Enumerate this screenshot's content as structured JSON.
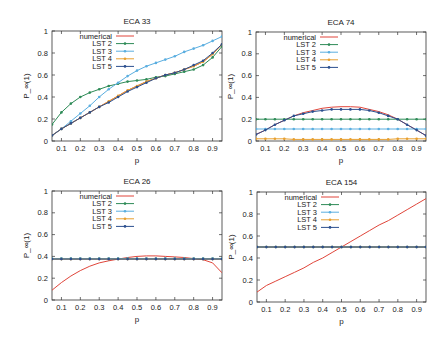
{
  "chart_data": [
    {
      "type": "line",
      "title": "ECA 33",
      "xlabel": "p",
      "ylabel": "P_∞(1)",
      "xlim": [
        0.05,
        0.95
      ],
      "ylim": [
        0,
        1
      ],
      "xticks": [
        "0.1",
        "0.2",
        "0.3",
        "0.4",
        "0.5",
        "0.6",
        "0.7",
        "0.8",
        "0.9"
      ],
      "yticks": [
        "0",
        "0.2",
        "0.4",
        "0.6",
        "0.8",
        "1"
      ],
      "legend": "top-left",
      "x": [
        0.05,
        0.1,
        0.15,
        0.2,
        0.25,
        0.3,
        0.35,
        0.4,
        0.45,
        0.5,
        0.55,
        0.6,
        0.65,
        0.7,
        0.75,
        0.8,
        0.85,
        0.9,
        0.95
      ],
      "series": [
        {
          "name": "numerical",
          "color": "#e0453a",
          "markers": false,
          "values": [
            0.05,
            0.11,
            0.16,
            0.21,
            0.26,
            0.31,
            0.36,
            0.41,
            0.46,
            0.5,
            0.54,
            0.57,
            0.6,
            0.62,
            0.65,
            0.68,
            0.72,
            0.79,
            0.88
          ]
        },
        {
          "name": "LST 2",
          "color": "#2e8b57",
          "markers": true,
          "values": [
            0.15,
            0.26,
            0.34,
            0.4,
            0.44,
            0.47,
            0.5,
            0.52,
            0.54,
            0.55,
            0.56,
            0.58,
            0.59,
            0.61,
            0.63,
            0.65,
            0.69,
            0.76,
            0.86
          ]
        },
        {
          "name": "LST 3",
          "color": "#5aaee0",
          "markers": true,
          "values": [
            0.05,
            0.11,
            0.18,
            0.25,
            0.32,
            0.4,
            0.47,
            0.53,
            0.59,
            0.64,
            0.68,
            0.71,
            0.74,
            0.77,
            0.81,
            0.84,
            0.87,
            0.91,
            0.95
          ]
        },
        {
          "name": "LST 4",
          "color": "#e8a030",
          "markers": true,
          "values": [
            0.05,
            0.11,
            0.16,
            0.21,
            0.26,
            0.31,
            0.36,
            0.41,
            0.46,
            0.5,
            0.54,
            0.57,
            0.6,
            0.62,
            0.65,
            0.68,
            0.72,
            0.79,
            0.88
          ]
        },
        {
          "name": "LST 5",
          "color": "#2b4f8e",
          "markers": true,
          "values": [
            0.05,
            0.11,
            0.16,
            0.21,
            0.26,
            0.31,
            0.35,
            0.4,
            0.45,
            0.49,
            0.53,
            0.57,
            0.6,
            0.62,
            0.65,
            0.69,
            0.73,
            0.8,
            0.88
          ]
        }
      ]
    },
    {
      "type": "line",
      "title": "ECA 74",
      "xlabel": "p",
      "ylabel": "P_∞(1)",
      "xlim": [
        0.05,
        0.95
      ],
      "ylim": [
        0,
        1
      ],
      "xticks": [
        "0.1",
        "0.2",
        "0.3",
        "0.4",
        "0.5",
        "0.6",
        "0.7",
        "0.8",
        "0.9"
      ],
      "yticks": [
        "0",
        "0.2",
        "0.4",
        "0.6",
        "0.8",
        "1"
      ],
      "legend": "top-left",
      "x": [
        0.05,
        0.1,
        0.15,
        0.2,
        0.25,
        0.3,
        0.35,
        0.4,
        0.45,
        0.5,
        0.55,
        0.6,
        0.65,
        0.7,
        0.75,
        0.8,
        0.85,
        0.9,
        0.95
      ],
      "series": [
        {
          "name": "numerical",
          "color": "#e0453a",
          "markers": false,
          "values": [
            0.06,
            0.1,
            0.15,
            0.19,
            0.23,
            0.26,
            0.28,
            0.3,
            0.31,
            0.315,
            0.315,
            0.31,
            0.29,
            0.27,
            0.24,
            0.2,
            0.15,
            0.1,
            0.05
          ]
        },
        {
          "name": "LST 2",
          "color": "#2e8b57",
          "markers": true,
          "values": [
            0.2,
            0.2,
            0.2,
            0.2,
            0.2,
            0.2,
            0.2,
            0.2,
            0.2,
            0.2,
            0.2,
            0.2,
            0.2,
            0.2,
            0.2,
            0.2,
            0.2,
            0.2,
            0.2
          ]
        },
        {
          "name": "LST 3",
          "color": "#5aaee0",
          "markers": true,
          "values": [
            0.11,
            0.11,
            0.11,
            0.11,
            0.11,
            0.11,
            0.11,
            0.11,
            0.11,
            0.11,
            0.11,
            0.11,
            0.11,
            0.11,
            0.11,
            0.11,
            0.11,
            0.11,
            0.11
          ]
        },
        {
          "name": "LST 4",
          "color": "#e8a030",
          "markers": true,
          "values": [
            0.02,
            0.02,
            0.02,
            0.02,
            0.015,
            0.015,
            0.015,
            0.015,
            0.015,
            0.015,
            0.015,
            0.015,
            0.015,
            0.015,
            0.015,
            0.02,
            0.02,
            0.02,
            0.02
          ]
        },
        {
          "name": "LST 5",
          "color": "#2b4f8e",
          "markers": true,
          "values": [
            0.06,
            0.1,
            0.15,
            0.19,
            0.23,
            0.25,
            0.27,
            0.28,
            0.29,
            0.29,
            0.29,
            0.29,
            0.28,
            0.26,
            0.23,
            0.2,
            0.15,
            0.1,
            0.05
          ]
        }
      ]
    },
    {
      "type": "line",
      "title": "ECA 26",
      "xlabel": "p",
      "ylabel": "P_∞(1)",
      "xlim": [
        0.05,
        0.95
      ],
      "ylim": [
        0,
        1
      ],
      "xticks": [
        "0.1",
        "0.2",
        "0.3",
        "0.4",
        "0.5",
        "0.6",
        "0.7",
        "0.8",
        "0.9"
      ],
      "yticks": [
        "0",
        "0.2",
        "0.4",
        "0.6",
        "0.8",
        "1"
      ],
      "legend": "top-left",
      "x": [
        0.05,
        0.1,
        0.15,
        0.2,
        0.25,
        0.3,
        0.35,
        0.4,
        0.45,
        0.5,
        0.55,
        0.6,
        0.65,
        0.7,
        0.75,
        0.8,
        0.85,
        0.9,
        0.95
      ],
      "series": [
        {
          "name": "numerical",
          "color": "#e0453a",
          "markers": false,
          "values": [
            0.09,
            0.16,
            0.22,
            0.27,
            0.31,
            0.34,
            0.36,
            0.375,
            0.39,
            0.4,
            0.405,
            0.405,
            0.4,
            0.395,
            0.39,
            0.38,
            0.37,
            0.34,
            0.25
          ]
        },
        {
          "name": "LST 2",
          "color": "#2e8b57",
          "markers": true,
          "values": [
            0.38,
            0.38,
            0.38,
            0.38,
            0.38,
            0.38,
            0.38,
            0.38,
            0.38,
            0.38,
            0.38,
            0.38,
            0.38,
            0.38,
            0.38,
            0.38,
            0.38,
            0.38,
            0.38
          ]
        },
        {
          "name": "LST 3",
          "color": "#5aaee0",
          "markers": true,
          "values": [
            0.38,
            0.38,
            0.38,
            0.38,
            0.38,
            0.38,
            0.38,
            0.38,
            0.38,
            0.38,
            0.38,
            0.38,
            0.38,
            0.38,
            0.38,
            0.38,
            0.38,
            0.38,
            0.38
          ]
        },
        {
          "name": "LST 4",
          "color": "#e8a030",
          "markers": true,
          "values": [
            0.375,
            0.375,
            0.375,
            0.375,
            0.375,
            0.375,
            0.375,
            0.375,
            0.375,
            0.375,
            0.375,
            0.375,
            0.375,
            0.375,
            0.375,
            0.375,
            0.375,
            0.375,
            0.375
          ]
        },
        {
          "name": "LST 5",
          "color": "#2b4f8e",
          "markers": true,
          "values": [
            0.375,
            0.375,
            0.375,
            0.375,
            0.375,
            0.375,
            0.375,
            0.375,
            0.375,
            0.375,
            0.375,
            0.375,
            0.375,
            0.375,
            0.375,
            0.375,
            0.375,
            0.375,
            0.375
          ]
        }
      ]
    },
    {
      "type": "line",
      "title": "ECA 154",
      "xlabel": "p",
      "ylabel": "P_∞(1)",
      "xlim": [
        0.05,
        0.95
      ],
      "ylim": [
        0,
        1
      ],
      "xticks": [
        "0.1",
        "0.2",
        "0.3",
        "0.4",
        "0.5",
        "0.6",
        "0.7",
        "0.8",
        "0.9"
      ],
      "yticks": [
        "0",
        "0.2",
        "0.4",
        "0.6",
        "0.8",
        "1"
      ],
      "legend": "top-left",
      "x": [
        0.05,
        0.1,
        0.15,
        0.2,
        0.25,
        0.3,
        0.35,
        0.4,
        0.45,
        0.5,
        0.55,
        0.6,
        0.65,
        0.7,
        0.75,
        0.8,
        0.85,
        0.9,
        0.95
      ],
      "series": [
        {
          "name": "numerical",
          "color": "#e0453a",
          "markers": false,
          "values": [
            0.09,
            0.15,
            0.19,
            0.23,
            0.27,
            0.31,
            0.36,
            0.4,
            0.45,
            0.5,
            0.55,
            0.6,
            0.65,
            0.7,
            0.74,
            0.79,
            0.84,
            0.89,
            0.94
          ]
        },
        {
          "name": "LST 2",
          "color": "#2e8b57",
          "markers": true,
          "values": [
            0.5,
            0.5,
            0.5,
            0.5,
            0.5,
            0.5,
            0.5,
            0.5,
            0.5,
            0.5,
            0.5,
            0.5,
            0.5,
            0.5,
            0.5,
            0.5,
            0.5,
            0.5,
            0.5
          ]
        },
        {
          "name": "LST 3",
          "color": "#5aaee0",
          "markers": true,
          "values": [
            0.5,
            0.5,
            0.5,
            0.5,
            0.5,
            0.5,
            0.5,
            0.5,
            0.5,
            0.5,
            0.5,
            0.5,
            0.5,
            0.5,
            0.5,
            0.5,
            0.5,
            0.5,
            0.5
          ]
        },
        {
          "name": "LST 4",
          "color": "#e8a030",
          "markers": true,
          "values": [
            0.5,
            0.5,
            0.5,
            0.5,
            0.5,
            0.5,
            0.5,
            0.5,
            0.5,
            0.5,
            0.5,
            0.5,
            0.5,
            0.5,
            0.5,
            0.5,
            0.5,
            0.5,
            0.5
          ]
        },
        {
          "name": "LST 5",
          "color": "#2b4f8e",
          "markers": true,
          "values": [
            0.5,
            0.5,
            0.5,
            0.5,
            0.5,
            0.5,
            0.5,
            0.5,
            0.5,
            0.5,
            0.5,
            0.5,
            0.5,
            0.5,
            0.5,
            0.5,
            0.5,
            0.5,
            0.5
          ]
        }
      ]
    }
  ]
}
